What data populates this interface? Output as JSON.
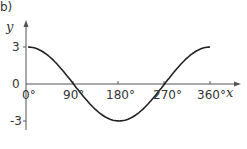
{
  "panel_label": "b)",
  "chart_data": {
    "type": "line",
    "title": "",
    "function": "y = 3cos(x)",
    "xlabel": "x",
    "ylabel": "y",
    "x_ticks": [
      "0°",
      "90°",
      "180°",
      "270°",
      "360°"
    ],
    "y_ticks": [
      "3",
      "0",
      "-3"
    ],
    "xlim": [
      0,
      360
    ],
    "ylim": [
      -3,
      3
    ],
    "grid": false,
    "series": [
      {
        "name": "y = 3cos x",
        "x": [
          0,
          45,
          90,
          135,
          180,
          225,
          270,
          315,
          360
        ],
        "values": [
          3,
          2.12,
          0,
          -2.12,
          -3,
          -2.12,
          0,
          2.12,
          3
        ]
      }
    ],
    "colors": {
      "curve": "#222222",
      "axes": "#555555"
    }
  }
}
